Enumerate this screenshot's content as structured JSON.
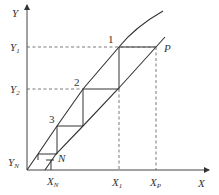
{
  "diagram": {
    "type": "staircase-equilibrium-diagram",
    "axes": {
      "x_label": "X",
      "y_label": "Y"
    },
    "y_ticks": [
      {
        "main": "Y",
        "sub": "1"
      },
      {
        "main": "Y",
        "sub": "2"
      },
      {
        "main": "Y",
        "sub": "N"
      }
    ],
    "x_ticks": [
      {
        "main": "X",
        "sub": "N"
      },
      {
        "main": "X",
        "sub": "1"
      },
      {
        "main": "X",
        "sub": "P"
      }
    ],
    "stage_labels": [
      "1",
      "2",
      "3"
    ],
    "point_labels": {
      "p": "P",
      "n": "N"
    },
    "colors": {
      "line": "#333333",
      "dash": "#555555",
      "background": "#ffffff"
    }
  }
}
